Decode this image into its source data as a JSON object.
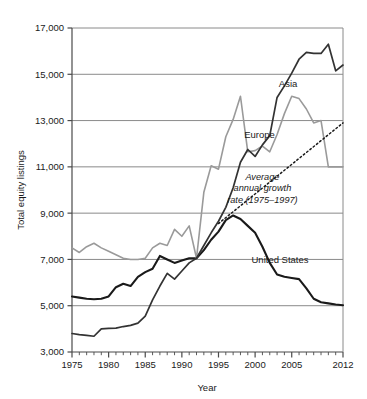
{
  "chart_data": {
    "type": "line",
    "title": "",
    "xlabel": "Year",
    "ylabel": "Total equity listings",
    "xlim": [
      1975,
      2012
    ],
    "ylim": [
      3000,
      17000
    ],
    "grid": true,
    "legend_position": "inline-annotations",
    "y_ticks": [
      3000,
      5000,
      7000,
      9000,
      11000,
      13000,
      15000,
      17000
    ],
    "y_tick_labels": [
      "3,000",
      "5,000",
      "7,000",
      "9,000",
      "11,000",
      "13,000",
      "15,000",
      "17,000"
    ],
    "x_ticks": [
      1975,
      1980,
      1985,
      1990,
      1995,
      2000,
      2005,
      2012
    ],
    "x_tick_labels": [
      "1975",
      "1980",
      "1985",
      "1990",
      "1995",
      "2000",
      "2005",
      "2012"
    ],
    "x_minor_tick_step": 1,
    "x": [
      1975,
      1976,
      1977,
      1978,
      1979,
      1980,
      1981,
      1982,
      1983,
      1984,
      1985,
      1986,
      1987,
      1988,
      1989,
      1990,
      1991,
      1992,
      1993,
      1994,
      1995,
      1996,
      1997,
      1998,
      1999,
      2000,
      2001,
      2002,
      2003,
      2004,
      2005,
      2006,
      2007,
      2008,
      2009,
      2010,
      2011,
      2012
    ],
    "series": [
      {
        "name": "United States",
        "color": "#1a1a1a",
        "width": 2.1,
        "label_x": 2003.4,
        "label_y": 6850,
        "values": [
          5400,
          5350,
          5300,
          5280,
          5300,
          5400,
          5800,
          5950,
          5850,
          6250,
          6450,
          6600,
          7150,
          7000,
          6850,
          6950,
          7050,
          7050,
          7400,
          7850,
          8200,
          8700,
          8900,
          8750,
          8450,
          8150,
          7550,
          6850,
          6350,
          6250,
          6200,
          6150,
          5750,
          5300,
          5150,
          5100,
          5050,
          5020
        ]
      },
      {
        "name": "Europe",
        "color": "#9a9a9a",
        "width": 1.6,
        "label_x": 2000.6,
        "label_y": 12250,
        "values": [
          7500,
          7300,
          7550,
          7700,
          7500,
          7350,
          7200,
          7050,
          7000,
          7000,
          7050,
          7500,
          7700,
          7600,
          8300,
          8000,
          8450,
          7050,
          9900,
          11050,
          10900,
          12300,
          13050,
          14050,
          11650,
          11700,
          11900,
          11650,
          12400,
          13300,
          14050,
          13950,
          13500,
          12900,
          13000,
          11000,
          11000,
          11000
        ]
      },
      {
        "name": "Asia",
        "color": "#333333",
        "width": 1.7,
        "label_x": 2004.5,
        "label_y": 14450,
        "values": [
          3800,
          3750,
          3720,
          3680,
          4000,
          4020,
          4030,
          4100,
          4150,
          4250,
          4550,
          5250,
          5850,
          6400,
          6150,
          6500,
          6850,
          7050,
          7600,
          8150,
          8650,
          9250,
          10100,
          11200,
          11750,
          11450,
          11950,
          12350,
          14000,
          14500,
          15050,
          15650,
          15950,
          15900,
          15900,
          16300,
          15150,
          15400
        ]
      }
    ],
    "trend": {
      "name": "Average annual growth rate (1975-1997)",
      "label_lines": [
        "Average",
        "annual  growth",
        "rate (1975–1997)"
      ],
      "style": "dotted",
      "color": "#1a1a1a",
      "x_start": 1995.0,
      "y_start": 8550,
      "x_end": 2012,
      "y_end": 12900,
      "label_x": 2001.0,
      "label_y": 10450
    }
  }
}
